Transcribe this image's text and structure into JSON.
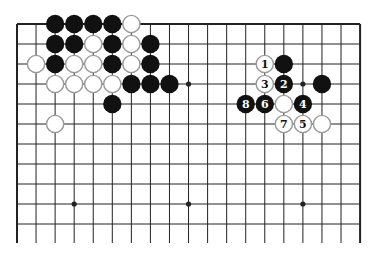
{
  "diagram": {
    "type": "go-board",
    "board_size": 19,
    "visible_columns": [
      0,
      18
    ],
    "visible_rows": [
      0,
      10
    ],
    "grid": {
      "left": 17,
      "top": 24,
      "col_step": 19.06,
      "row_step": 20,
      "bottom_cut": 243
    },
    "colors": {
      "line": "#222222",
      "black_stone": "#111111",
      "white_stone": "#ffffff",
      "white_stone_edge": "#9a9a9a",
      "background": "#ffffff"
    },
    "hoshi": [
      {
        "c": 3,
        "r": 3
      },
      {
        "c": 9,
        "r": 3
      },
      {
        "c": 15,
        "r": 3
      },
      {
        "c": 3,
        "r": 9
      },
      {
        "c": 9,
        "r": 9
      },
      {
        "c": 15,
        "r": 9
      }
    ],
    "stones": [
      {
        "color": "black",
        "c": 2,
        "r": 0
      },
      {
        "color": "black",
        "c": 3,
        "r": 0
      },
      {
        "color": "black",
        "c": 4,
        "r": 0
      },
      {
        "color": "black",
        "c": 5,
        "r": 0
      },
      {
        "color": "white",
        "c": 6,
        "r": 0
      },
      {
        "color": "black",
        "c": 2,
        "r": 1
      },
      {
        "color": "black",
        "c": 3,
        "r": 1
      },
      {
        "color": "white",
        "c": 4,
        "r": 1
      },
      {
        "color": "black",
        "c": 5,
        "r": 1
      },
      {
        "color": "white",
        "c": 6,
        "r": 1
      },
      {
        "color": "black",
        "c": 7,
        "r": 1
      },
      {
        "color": "white",
        "c": 1,
        "r": 2
      },
      {
        "color": "black",
        "c": 2,
        "r": 2
      },
      {
        "color": "white",
        "c": 3,
        "r": 2
      },
      {
        "color": "white",
        "c": 4,
        "r": 2
      },
      {
        "color": "black",
        "c": 5,
        "r": 2
      },
      {
        "color": "white",
        "c": 6,
        "r": 2
      },
      {
        "color": "black",
        "c": 7,
        "r": 2
      },
      {
        "color": "white",
        "c": 2,
        "r": 3
      },
      {
        "color": "white",
        "c": 3,
        "r": 3
      },
      {
        "color": "white",
        "c": 4,
        "r": 3
      },
      {
        "color": "white",
        "c": 5,
        "r": 3
      },
      {
        "color": "black",
        "c": 6,
        "r": 3
      },
      {
        "color": "black",
        "c": 7,
        "r": 3
      },
      {
        "color": "black",
        "c": 8,
        "r": 3
      },
      {
        "color": "black",
        "c": 5,
        "r": 4
      },
      {
        "color": "white",
        "c": 2,
        "r": 5
      },
      {
        "color": "white",
        "c": 13,
        "r": 2,
        "label": "1"
      },
      {
        "color": "black",
        "c": 14,
        "r": 2
      },
      {
        "color": "white",
        "c": 13,
        "r": 3,
        "label": "3"
      },
      {
        "color": "black",
        "c": 14,
        "r": 3,
        "label": "2"
      },
      {
        "color": "black",
        "c": 16,
        "r": 3
      },
      {
        "color": "black",
        "c": 12,
        "r": 4,
        "label": "8"
      },
      {
        "color": "black",
        "c": 13,
        "r": 4,
        "label": "6"
      },
      {
        "color": "white",
        "c": 14,
        "r": 4
      },
      {
        "color": "black",
        "c": 15,
        "r": 4,
        "label": "4"
      },
      {
        "color": "white",
        "c": 14,
        "r": 5,
        "label": "7"
      },
      {
        "color": "white",
        "c": 15,
        "r": 5,
        "label": "5"
      },
      {
        "color": "white",
        "c": 16,
        "r": 5
      }
    ]
  }
}
